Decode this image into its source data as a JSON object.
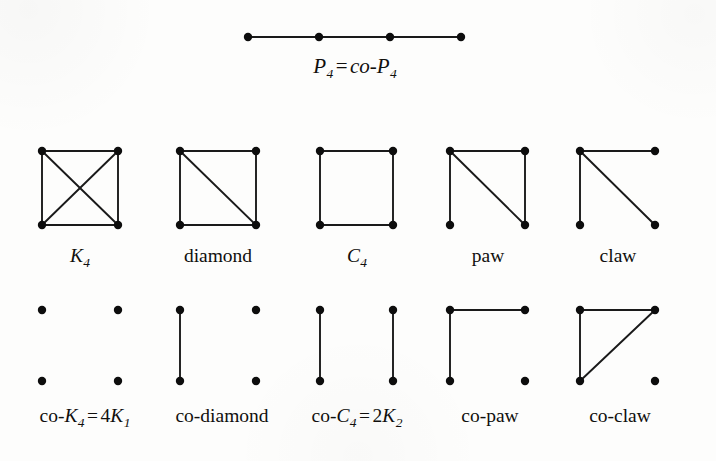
{
  "figure": {
    "title_row": {
      "label_parts": [
        {
          "text": "P",
          "style": "italic"
        },
        {
          "text": "4",
          "style": "subscript"
        },
        {
          "text": "=",
          "style": "equals"
        },
        {
          "text": "co",
          "style": "italic"
        },
        {
          "text": "-",
          "style": "roman"
        },
        {
          "text": "P",
          "style": "italic"
        },
        {
          "text": "4",
          "style": "subscript"
        }
      ],
      "label_text": "P4 = co-P4",
      "graph_name": "path-p4",
      "vertex_count": 4,
      "edge_count": 3
    },
    "row1_labels": [
      {
        "id": "k4",
        "text": "K4",
        "parts": [
          {
            "text": "K",
            "style": "italic"
          },
          {
            "text": "4",
            "style": "subscript"
          }
        ]
      },
      {
        "id": "diamond",
        "text": "diamond",
        "parts": [
          {
            "text": "diamond",
            "style": "roman"
          }
        ]
      },
      {
        "id": "c4",
        "text": "C4",
        "parts": [
          {
            "text": "C",
            "style": "italic"
          },
          {
            "text": "4",
            "style": "subscript"
          }
        ]
      },
      {
        "id": "paw",
        "text": "paw",
        "parts": [
          {
            "text": "paw",
            "style": "roman"
          }
        ]
      },
      {
        "id": "claw",
        "text": "claw",
        "parts": [
          {
            "text": "claw",
            "style": "roman"
          }
        ]
      }
    ],
    "row2_labels": [
      {
        "id": "co-k4",
        "text": "co-K4 = 4K1",
        "parts": [
          {
            "text": "co-",
            "style": "roman"
          },
          {
            "text": "K",
            "style": "italic"
          },
          {
            "text": "4",
            "style": "subscript"
          },
          {
            "text": "=",
            "style": "equals"
          },
          {
            "text": "4",
            "style": "roman"
          },
          {
            "text": "K",
            "style": "italic"
          },
          {
            "text": "1",
            "style": "subscript"
          }
        ]
      },
      {
        "id": "co-diamond",
        "text": "co-diamond",
        "parts": [
          {
            "text": "co-diamond",
            "style": "roman"
          }
        ]
      },
      {
        "id": "co-c4",
        "text": "co-C4 = 2K2",
        "parts": [
          {
            "text": "co-",
            "style": "roman"
          },
          {
            "text": "C",
            "style": "italic"
          },
          {
            "text": "4",
            "style": "subscript"
          },
          {
            "text": "=",
            "style": "equals"
          },
          {
            "text": "2",
            "style": "roman"
          },
          {
            "text": "K",
            "style": "italic"
          },
          {
            "text": "2",
            "style": "subscript"
          }
        ]
      },
      {
        "id": "co-paw",
        "text": "co-paw",
        "parts": [
          {
            "text": "co-paw",
            "style": "roman"
          }
        ]
      },
      {
        "id": "co-claw",
        "text": "co-claw",
        "parts": [
          {
            "text": "co-claw",
            "style": "roman"
          }
        ]
      }
    ],
    "colors": {
      "ink": "#111111",
      "paper": "#fdfdfc",
      "vertex": "#0d0d0d",
      "edge": "#1a1a1a"
    },
    "geometry": {
      "vertex_radius": 4.2,
      "edge_width": 1.9,
      "columns_x": [
        [
          42,
          118
        ],
        [
          180,
          256
        ],
        [
          320,
          393
        ],
        [
          450,
          525
        ],
        [
          580,
          655
        ]
      ],
      "row1_y": [
        151,
        225
      ],
      "row2_y": [
        310,
        381
      ],
      "p4_y": 37,
      "p4_x": [
        248,
        319,
        390,
        461
      ]
    },
    "graphs": {
      "row1": [
        {
          "id": "k4",
          "vertices": [
            "tl",
            "tr",
            "bl",
            "br"
          ],
          "edges": [
            [
              "tl",
              "tr"
            ],
            [
              "tl",
              "bl"
            ],
            [
              "tr",
              "br"
            ],
            [
              "bl",
              "br"
            ],
            [
              "tl",
              "br"
            ],
            [
              "tr",
              "bl"
            ]
          ]
        },
        {
          "id": "diamond",
          "vertices": [
            "tl",
            "tr",
            "bl",
            "br"
          ],
          "edges": [
            [
              "tl",
              "tr"
            ],
            [
              "tl",
              "bl"
            ],
            [
              "tr",
              "br"
            ],
            [
              "bl",
              "br"
            ],
            [
              "tl",
              "br"
            ]
          ]
        },
        {
          "id": "c4",
          "vertices": [
            "tl",
            "tr",
            "bl",
            "br"
          ],
          "edges": [
            [
              "tl",
              "tr"
            ],
            [
              "tl",
              "bl"
            ],
            [
              "tr",
              "br"
            ],
            [
              "bl",
              "br"
            ]
          ]
        },
        {
          "id": "paw",
          "vertices": [
            "tl",
            "tr",
            "bl",
            "br"
          ],
          "edges": [
            [
              "tl",
              "tr"
            ],
            [
              "tl",
              "bl"
            ],
            [
              "tr",
              "br"
            ],
            [
              "tl",
              "br"
            ]
          ]
        },
        {
          "id": "claw",
          "vertices": [
            "tl",
            "tr",
            "bl",
            "br"
          ],
          "edges": [
            [
              "tl",
              "tr"
            ],
            [
              "tl",
              "bl"
            ],
            [
              "tl",
              "br"
            ]
          ]
        }
      ],
      "row2": [
        {
          "id": "co-k4",
          "vertices": [
            "tl",
            "tr",
            "bl",
            "br"
          ],
          "edges": []
        },
        {
          "id": "co-diamond",
          "vertices": [
            "tl",
            "tr",
            "bl",
            "br"
          ],
          "edges": [
            [
              "tl",
              "bl"
            ]
          ]
        },
        {
          "id": "co-c4",
          "vertices": [
            "tl",
            "tr",
            "bl",
            "br"
          ],
          "edges": [
            [
              "tl",
              "bl"
            ],
            [
              "tr",
              "br"
            ]
          ]
        },
        {
          "id": "co-paw",
          "vertices": [
            "tl",
            "tr",
            "bl",
            "br"
          ],
          "edges": [
            [
              "tl",
              "tr"
            ],
            [
              "tl",
              "bl"
            ]
          ]
        },
        {
          "id": "co-claw",
          "vertices": [
            "tl",
            "tr",
            "bl",
            "br"
          ],
          "edges": [
            [
              "tl",
              "tr"
            ],
            [
              "tl",
              "bl"
            ],
            [
              "bl",
              "tr"
            ]
          ]
        }
      ]
    }
  }
}
